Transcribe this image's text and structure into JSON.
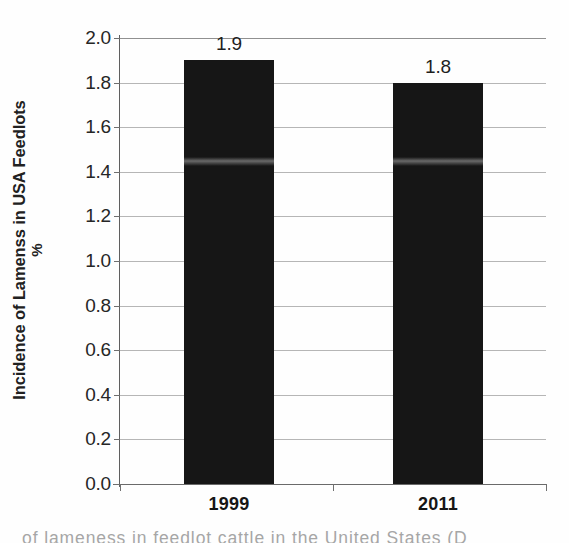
{
  "chart_data": {
    "type": "bar",
    "title": "",
    "categories": [
      "1999",
      "2011"
    ],
    "values": [
      1.9,
      1.8
    ],
    "data_labels": [
      "1.9",
      "1.8"
    ],
    "series": [
      {
        "name": "Incidence of lameness",
        "values": [
          1.9,
          1.8
        ]
      }
    ],
    "xlabel": "",
    "ylabel": "Incidence of Lamenss in USA Feedlots",
    "ylabel_line2": "%",
    "ylim": [
      0.0,
      2.0
    ],
    "ytick_labels": [
      "2.0",
      "1.8",
      "1.6",
      "1.4",
      "1.2",
      "1.0",
      "0.8",
      "0.6",
      "0.4",
      "0.2",
      "0.0"
    ],
    "ytick_values": [
      2.0,
      1.8,
      1.6,
      1.4,
      1.2,
      1.0,
      0.8,
      0.6,
      0.4,
      0.2,
      0.0
    ],
    "grid": true,
    "legend": "none",
    "bar_color": "#161616",
    "grid_color": "#9a9a9a",
    "axis_color": "#6a6a6a",
    "text_color": "#1e1e1e"
  },
  "axis": {
    "y_title_line1": "Incidence of Lamenss in USA Feedlots",
    "y_title_line2": "%"
  },
  "caption": {
    "text": "of lameness in feedlot cattle in the United States (D"
  }
}
